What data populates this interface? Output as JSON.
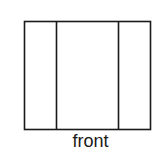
{
  "diagram": {
    "caption": "front",
    "outer_rect": {
      "x": 24.5,
      "y": 21.5,
      "width": 126,
      "height": 108
    },
    "dividers": [
      {
        "x": 56.5
      },
      {
        "x": 118.5
      }
    ],
    "stroke_color": "#1a1a1a",
    "stroke_width": 1.6
  }
}
